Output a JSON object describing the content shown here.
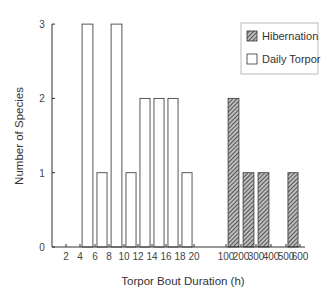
{
  "chart_data": {
    "type": "bar",
    "title": "",
    "xlabel": "Torpor Bout Duration (h)",
    "ylabel": "Number of Species",
    "ylim": [
      0,
      3
    ],
    "yticks": [
      0,
      1,
      2,
      3
    ],
    "xticks": [
      "2",
      "4",
      "6",
      "8",
      "10",
      "12",
      "14",
      "16",
      "18",
      "20",
      "100",
      "200",
      "300",
      "400",
      "500",
      "600"
    ],
    "grid": false,
    "legend_position": "top-right",
    "series": [
      {
        "name": "Daily Torpor",
        "fill": "open",
        "bins": [
          {
            "range": "4-6",
            "value": 3
          },
          {
            "range": "6-8",
            "value": 1
          },
          {
            "range": "8-10",
            "value": 3
          },
          {
            "range": "10-12",
            "value": 1
          },
          {
            "range": "12-14",
            "value": 2
          },
          {
            "range": "14-16",
            "value": 2
          },
          {
            "range": "16-18",
            "value": 2
          },
          {
            "range": "18-20",
            "value": 1
          }
        ]
      },
      {
        "name": "Hibernation",
        "fill": "hatched",
        "bins": [
          {
            "range": "100-200",
            "value": 2
          },
          {
            "range": "200-300",
            "value": 1
          },
          {
            "range": "300-400",
            "value": 1
          },
          {
            "range": "500-600",
            "value": 1
          }
        ]
      }
    ]
  },
  "legend": {
    "items": [
      {
        "label": "Hibernation",
        "swatch": "hatched"
      },
      {
        "label": "Daily Torpor",
        "swatch": "open"
      }
    ]
  },
  "colors": {
    "axis": "#333333",
    "bar_edge": "#444444",
    "hatch_dark": "#3a3a3a",
    "hatch_light": "#bdbdbd"
  }
}
